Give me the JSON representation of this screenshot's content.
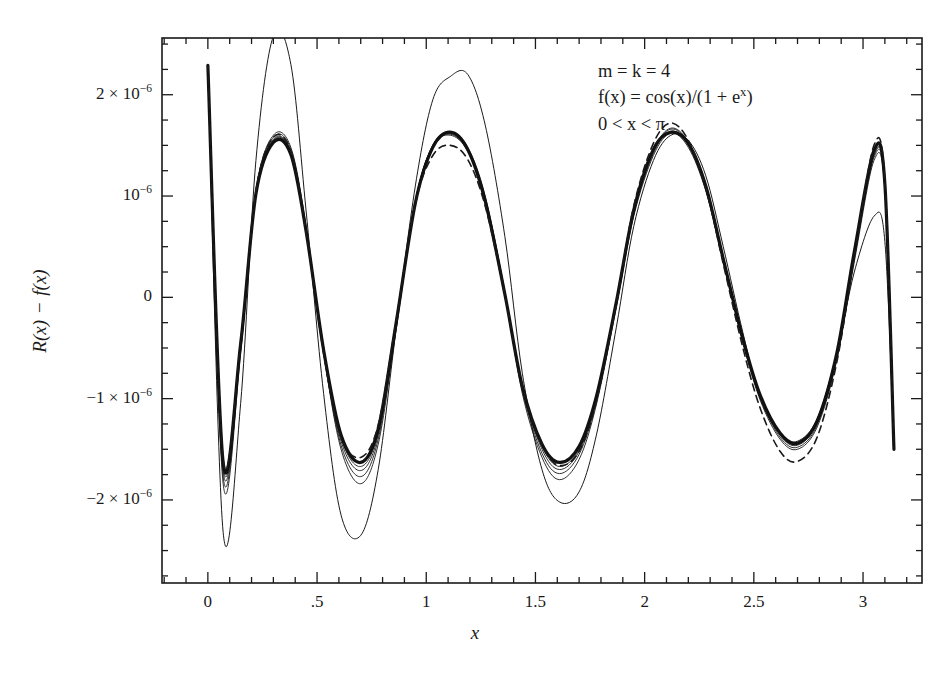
{
  "figure": {
    "name": "error-curve-plot",
    "background": "#ffffff",
    "ink": "#1a1a1a"
  },
  "annotation": {
    "line1_prefix": "m",
    "line1": "m = k = 4",
    "line2": "f(x) = cos(x)/(1 + e",
    "line2_sup": "x",
    "line2_suffix": ")",
    "line3": "0 < x < π"
  },
  "axes": {
    "x_title": "x",
    "y_title_part1": "R(x)",
    "y_title_minus": "−",
    "y_title_part2": "f(x)",
    "x_ticks": [
      {
        "value": 0,
        "label": "0"
      },
      {
        "value": 0.5,
        "label": ".5"
      },
      {
        "value": 1.0,
        "label": "1"
      },
      {
        "value": 1.5,
        "label": "1.5"
      },
      {
        "value": 2.0,
        "label": "2"
      },
      {
        "value": 2.5,
        "label": "2.5"
      },
      {
        "value": 3.0,
        "label": "3"
      }
    ],
    "y_ticks": [
      {
        "value": 2,
        "label": "2 × 10",
        "sup": "−6"
      },
      {
        "value": 1,
        "label": "10",
        "sup": "−6"
      },
      {
        "value": 0,
        "label": "0",
        "sup": ""
      },
      {
        "value": -1,
        "label": "−1 × 10",
        "sup": "−6"
      },
      {
        "value": -2,
        "label": "−2 × 10",
        "sup": "−6"
      }
    ],
    "x_range": [
      -0.21,
      3.27
    ],
    "y_range": [
      -2.82,
      2.56
    ],
    "x_minor_step": 0.1,
    "y_minor_step": 0.25,
    "grid": false,
    "frame": true,
    "ticks_inward": true
  },
  "chart_data": {
    "type": "line",
    "title": "",
    "xlabel": "x",
    "ylabel": "R(x) - f(x)",
    "xlim": [
      -0.21,
      3.27
    ],
    "ylim": [
      -2.82,
      2.56
    ],
    "units": "1e-6",
    "note": "Equioscillating error curves of successive Remez iterations for rational approximation R of f(x)=cos(x)/(1+e^x), m=k=4, on 0<x<pi. Thin curves = intermediate iterates, thick solid = converged best approximation, dashed = reference iterate.",
    "legend_position": "none",
    "series": [
      {
        "name": "iterate-outer",
        "style": "thin-solid",
        "linewidth": 1.0,
        "dash": false,
        "color": "#1a1a1a",
        "amplitude": 2.6,
        "x": [
          0.0,
          0.07,
          0.15,
          0.22,
          0.3,
          0.38,
          0.45,
          0.53,
          0.61,
          0.7,
          0.78,
          0.86,
          0.95,
          1.03,
          1.11,
          1.19,
          1.27,
          1.36,
          1.44,
          1.53,
          1.61,
          1.7,
          1.78,
          1.87,
          1.95,
          2.04,
          2.12,
          2.2,
          2.28,
          2.36,
          2.45,
          2.53,
          2.62,
          2.7,
          2.79,
          2.88,
          2.96,
          3.05,
          3.1,
          3.1416
        ],
        "y": [
          2.29,
          -2.32,
          -1.05,
          1.35,
          2.58,
          2.3,
          0.85,
          -0.95,
          -2.15,
          -2.35,
          -1.7,
          -0.35,
          1.1,
          1.95,
          2.18,
          2.2,
          1.7,
          0.6,
          -0.75,
          -1.7,
          -2.02,
          -1.92,
          -1.35,
          -0.3,
          0.7,
          1.35,
          1.6,
          1.55,
          1.2,
          0.5,
          -0.35,
          -1.0,
          -1.35,
          -1.42,
          -1.2,
          -0.55,
          0.25,
          0.8,
          0.55,
          -1.45
        ]
      },
      {
        "name": "iterate-2",
        "style": "thin-solid",
        "linewidth": 0.9,
        "dash": false,
        "color": "#1a1a1a",
        "amplitude": 1.85,
        "x": [
          0.0,
          0.07,
          0.15,
          0.22,
          0.3,
          0.38,
          0.45,
          0.53,
          0.61,
          0.7,
          0.78,
          0.86,
          0.95,
          1.03,
          1.11,
          1.19,
          1.27,
          1.36,
          1.44,
          1.53,
          1.61,
          1.7,
          1.78,
          1.87,
          1.95,
          2.04,
          2.12,
          2.2,
          2.28,
          2.36,
          2.45,
          2.53,
          2.62,
          2.7,
          2.79,
          2.88,
          2.96,
          3.05,
          3.1,
          3.1416
        ],
        "y": [
          2.29,
          -1.84,
          -0.55,
          1.05,
          1.6,
          1.48,
          0.7,
          -0.55,
          -1.5,
          -1.84,
          -1.45,
          -0.35,
          0.95,
          1.5,
          1.63,
          1.48,
          1.0,
          0.05,
          -0.95,
          -1.58,
          -1.8,
          -1.6,
          -1.05,
          -0.1,
          0.8,
          1.4,
          1.62,
          1.48,
          1.05,
          0.35,
          -0.45,
          -1.02,
          -1.4,
          -1.5,
          -1.28,
          -0.62,
          0.35,
          1.35,
          1.05,
          -1.48
        ]
      },
      {
        "name": "iterate-3",
        "style": "thin-solid",
        "linewidth": 0.9,
        "dash": false,
        "color": "#1a1a1a",
        "amplitude": 1.78,
        "x": [
          0.0,
          0.07,
          0.15,
          0.22,
          0.3,
          0.38,
          0.45,
          0.53,
          0.61,
          0.7,
          0.78,
          0.86,
          0.95,
          1.03,
          1.11,
          1.19,
          1.27,
          1.36,
          1.44,
          1.53,
          1.61,
          1.7,
          1.78,
          1.87,
          1.95,
          2.04,
          2.12,
          2.2,
          2.28,
          2.36,
          2.45,
          2.53,
          2.62,
          2.7,
          2.79,
          2.88,
          2.96,
          3.05,
          3.1,
          3.1416
        ],
        "y": [
          2.29,
          -1.77,
          -0.52,
          1.05,
          1.58,
          1.46,
          0.68,
          -0.55,
          -1.46,
          -1.77,
          -1.4,
          -0.32,
          0.95,
          1.5,
          1.62,
          1.46,
          0.98,
          0.05,
          -0.92,
          -1.54,
          -1.74,
          -1.55,
          -1.02,
          -0.08,
          0.82,
          1.42,
          1.64,
          1.5,
          1.06,
          0.36,
          -0.44,
          -1.0,
          -1.38,
          -1.48,
          -1.26,
          -0.6,
          0.38,
          1.38,
          1.08,
          -1.48
        ]
      },
      {
        "name": "iterate-4",
        "style": "thin-solid",
        "linewidth": 0.9,
        "dash": false,
        "color": "#1a1a1a",
        "amplitude": 1.72,
        "x": [
          0.0,
          0.07,
          0.15,
          0.22,
          0.3,
          0.38,
          0.45,
          0.53,
          0.61,
          0.7,
          0.78,
          0.86,
          0.95,
          1.03,
          1.11,
          1.19,
          1.27,
          1.36,
          1.44,
          1.53,
          1.61,
          1.7,
          1.78,
          1.87,
          1.95,
          2.04,
          2.12,
          2.2,
          2.28,
          2.36,
          2.45,
          2.53,
          2.62,
          2.7,
          2.79,
          2.88,
          2.96,
          3.05,
          3.1,
          3.1416
        ],
        "y": [
          2.29,
          -1.71,
          -0.5,
          1.04,
          1.56,
          1.44,
          0.67,
          -0.54,
          -1.42,
          -1.71,
          -1.36,
          -0.3,
          0.94,
          1.5,
          1.61,
          1.45,
          0.97,
          0.05,
          -0.9,
          -1.5,
          -1.7,
          -1.52,
          -1.0,
          -0.07,
          0.84,
          1.44,
          1.66,
          1.52,
          1.08,
          0.37,
          -0.43,
          -0.99,
          -1.36,
          -1.46,
          -1.24,
          -0.58,
          0.4,
          1.4,
          1.1,
          -1.48
        ]
      },
      {
        "name": "iterate-5",
        "style": "thin-solid",
        "linewidth": 0.9,
        "dash": false,
        "color": "#1a1a1a",
        "amplitude": 1.68,
        "x": [
          0.0,
          0.07,
          0.15,
          0.22,
          0.3,
          0.38,
          0.45,
          0.53,
          0.61,
          0.7,
          0.78,
          0.86,
          0.95,
          1.03,
          1.11,
          1.19,
          1.27,
          1.36,
          1.44,
          1.53,
          1.61,
          1.7,
          1.78,
          1.87,
          1.95,
          2.04,
          2.12,
          2.2,
          2.28,
          2.36,
          2.45,
          2.53,
          2.62,
          2.7,
          2.79,
          2.88,
          2.96,
          3.05,
          3.1,
          3.1416
        ],
        "y": [
          2.29,
          -1.67,
          -0.48,
          1.03,
          1.55,
          1.43,
          0.66,
          -0.53,
          -1.39,
          -1.67,
          -1.33,
          -0.29,
          0.94,
          1.49,
          1.6,
          1.44,
          0.96,
          0.04,
          -0.89,
          -1.47,
          -1.67,
          -1.5,
          -0.99,
          -0.06,
          0.85,
          1.45,
          1.67,
          1.53,
          1.09,
          0.38,
          -0.42,
          -0.98,
          -1.35,
          -1.45,
          -1.23,
          -0.57,
          0.41,
          1.41,
          1.11,
          -1.48
        ]
      },
      {
        "name": "converged-thick",
        "style": "thick-solid",
        "linewidth": 3.2,
        "dash": false,
        "color": "#111111",
        "amplitude": 1.63,
        "x": [
          0.0,
          0.07,
          0.15,
          0.22,
          0.3,
          0.38,
          0.45,
          0.53,
          0.61,
          0.7,
          0.78,
          0.86,
          0.95,
          1.03,
          1.11,
          1.19,
          1.27,
          1.36,
          1.44,
          1.53,
          1.61,
          1.7,
          1.78,
          1.87,
          1.95,
          2.04,
          2.12,
          2.2,
          2.28,
          2.36,
          2.45,
          2.53,
          2.62,
          2.7,
          2.79,
          2.88,
          2.96,
          3.05,
          3.1,
          3.1416
        ],
        "y": [
          2.29,
          -1.63,
          -0.46,
          1.02,
          1.53,
          1.41,
          0.65,
          -0.52,
          -1.36,
          -1.63,
          -1.3,
          -0.28,
          0.93,
          1.48,
          1.63,
          1.46,
          0.95,
          0.03,
          -0.88,
          -1.45,
          -1.63,
          -1.47,
          -0.97,
          -0.05,
          0.86,
          1.46,
          1.63,
          1.52,
          1.1,
          0.38,
          -0.41,
          -0.97,
          -1.34,
          -1.44,
          -1.22,
          -0.55,
          0.45,
          1.45,
          1.12,
          -1.5
        ]
      },
      {
        "name": "reference-dashed",
        "style": "dashed",
        "linewidth": 1.6,
        "dash": true,
        "color": "#1a1a1a",
        "amplitude": 1.7,
        "x": [
          0.0,
          0.07,
          0.15,
          0.22,
          0.3,
          0.38,
          0.45,
          0.53,
          0.61,
          0.7,
          0.78,
          0.86,
          0.95,
          1.03,
          1.11,
          1.19,
          1.27,
          1.36,
          1.44,
          1.53,
          1.61,
          1.7,
          1.78,
          1.87,
          1.95,
          2.04,
          2.12,
          2.2,
          2.28,
          2.36,
          2.45,
          2.53,
          2.62,
          2.7,
          2.79,
          2.88,
          2.96,
          3.05,
          3.1,
          3.1416
        ],
        "y": [
          2.29,
          -1.6,
          -0.44,
          1.05,
          1.58,
          1.44,
          0.64,
          -0.55,
          -1.38,
          -1.58,
          -1.26,
          -0.26,
          0.92,
          1.4,
          1.5,
          1.36,
          0.9,
          0.02,
          -0.88,
          -1.46,
          -1.66,
          -1.52,
          -1.02,
          -0.06,
          0.9,
          1.52,
          1.72,
          1.55,
          1.08,
          0.33,
          -0.5,
          -1.1,
          -1.52,
          -1.62,
          -1.38,
          -0.64,
          0.4,
          1.5,
          1.15,
          -1.5
        ]
      }
    ]
  }
}
